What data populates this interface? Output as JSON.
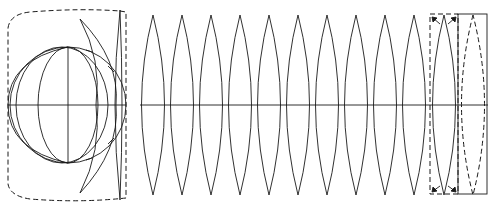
{
  "diagram": {
    "title": "",
    "colors": {
      "stroke": "#1a1a1a",
      "background": "#ffffff"
    },
    "globe": {
      "cx": 68,
      "cy": 105,
      "r": 58
    },
    "gores": {
      "count": 12,
      "start_x": 130,
      "width": 29,
      "top_y": 15,
      "bottom_y": 195,
      "equator_y": 105
    },
    "dashed_box": {
      "x": 430,
      "y": 14,
      "w": 28,
      "h": 180
    },
    "solid_box": {
      "x": 458,
      "y": 14,
      "w": 29,
      "h": 180
    }
  }
}
